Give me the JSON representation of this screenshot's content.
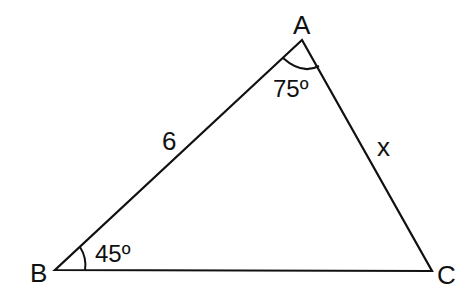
{
  "diagram": {
    "type": "triangle",
    "vertices": {
      "A": {
        "label": "A"
      },
      "B": {
        "label": "B"
      },
      "C": {
        "label": "C"
      }
    },
    "sides": {
      "AB": {
        "label": "6"
      },
      "AC": {
        "label": "x"
      }
    },
    "angles": {
      "A": {
        "label": "75º"
      },
      "B": {
        "label": "45º"
      }
    },
    "colors": {
      "stroke": "#111111",
      "background": "#ffffff"
    }
  }
}
